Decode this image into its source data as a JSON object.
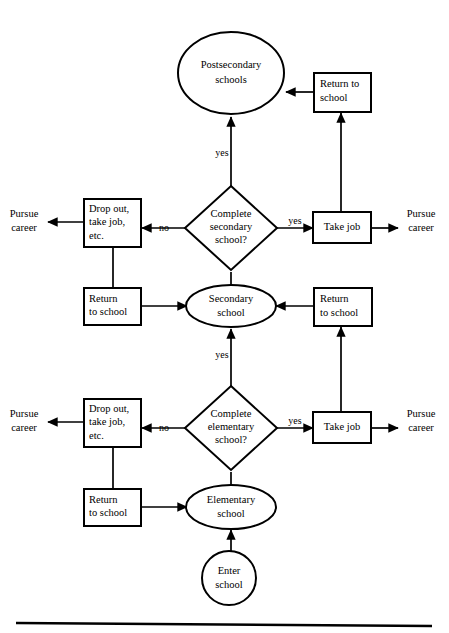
{
  "figure": {
    "type": "flowchart",
    "background_color": "#ffffff",
    "line_color": "#000000"
  },
  "nodes": {
    "postsecondary_schools": {
      "label_line1": "Postsecondary",
      "label_line2": "schools",
      "shape": "ellipse"
    },
    "return_to_school_top": {
      "label_line1": "Return to",
      "label_line2": "school",
      "shape": "rectangle"
    },
    "complete_secondary": {
      "label_line1": "Complete",
      "label_line2": "secondary",
      "label_line3": "school?",
      "shape": "diamond"
    },
    "drop_out_secondary": {
      "label_line1": "Drop out,",
      "label_line2": "take job,",
      "label_line3": "etc.",
      "shape": "rectangle"
    },
    "take_job_secondary": {
      "label_line1": "Take job",
      "shape": "rectangle"
    },
    "pursue_career_secondary_left": {
      "label_line1": "Pursue",
      "label_line2": "career",
      "shape": "text"
    },
    "pursue_career_secondary_right": {
      "label_line1": "Pursue",
      "label_line2": "career",
      "shape": "text"
    },
    "return_to_school_secondary_left": {
      "label_line1": "Return",
      "label_line2": "to school",
      "shape": "rectangle"
    },
    "return_to_school_secondary_right": {
      "label_line1": "Return",
      "label_line2": "to school",
      "shape": "rectangle"
    },
    "secondary_school": {
      "label_line1": "Secondary",
      "label_line2": "school",
      "shape": "ellipse"
    },
    "complete_elementary": {
      "label_line1": "Complete",
      "label_line2": "elementary",
      "label_line3": "school?",
      "shape": "diamond"
    },
    "drop_out_elementary": {
      "label_line1": "Drop out,",
      "label_line2": "take job,",
      "label_line3": "etc.",
      "shape": "rectangle"
    },
    "take_job_elementary": {
      "label_line1": "Take job",
      "shape": "rectangle"
    },
    "pursue_career_elementary_left": {
      "label_line1": "Pursue",
      "label_line2": "career",
      "shape": "text"
    },
    "pursue_career_elementary_right": {
      "label_line1": "Pursue",
      "label_line2": "career",
      "shape": "text"
    },
    "return_to_school_elementary_left": {
      "label_line1": "Return",
      "label_line2": "to school",
      "shape": "rectangle"
    },
    "elementary_school": {
      "label_line1": "Elementary",
      "label_line2": "school",
      "shape": "ellipse"
    },
    "enter_school": {
      "label_line1": "Enter",
      "label_line2": "school",
      "shape": "circle"
    }
  },
  "edge_labels": {
    "secondary_yes_up": "yes",
    "secondary_yes_right": "yes",
    "secondary_no_left": "no",
    "elementary_yes_up": "yes",
    "elementary_yes_right": "yes",
    "elementary_no_left": "no"
  }
}
